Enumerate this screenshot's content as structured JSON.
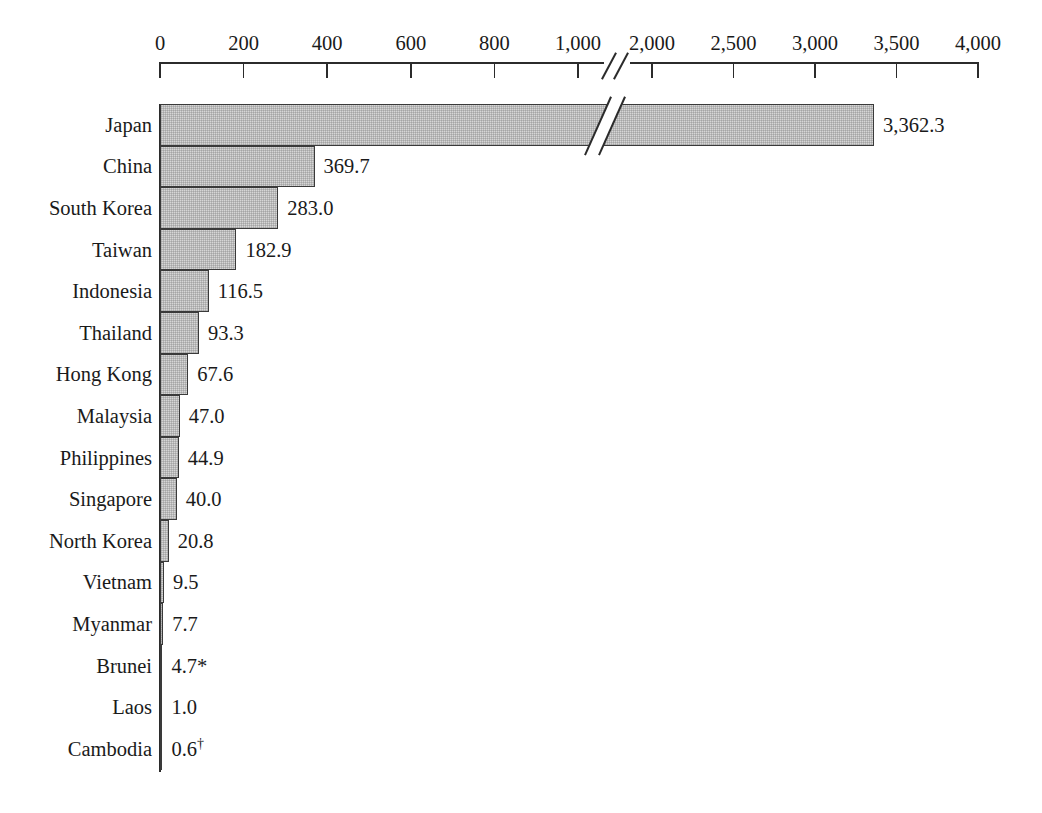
{
  "chart_data": {
    "type": "bar",
    "orientation": "horizontal",
    "title": "",
    "subtitle": "",
    "xlabel": "",
    "ylabel": "",
    "grid": false,
    "legend": null,
    "axis_break": {
      "present": true,
      "between": [
        1000,
        2000
      ],
      "note": "scale compresses between 1,000 and 2,000"
    },
    "xticks": [
      {
        "value": 0,
        "label": "0"
      },
      {
        "value": 200,
        "label": "200"
      },
      {
        "value": 400,
        "label": "400"
      },
      {
        "value": 600,
        "label": "600"
      },
      {
        "value": 800,
        "label": "800"
      },
      {
        "value": 1000,
        "label": "1,000"
      },
      {
        "value": 2000,
        "label": "2,000"
      },
      {
        "value": 2500,
        "label": "2,500"
      },
      {
        "value": 3000,
        "label": "3,000"
      },
      {
        "value": 3500,
        "label": "3,500"
      },
      {
        "value": 4000,
        "label": "4,000"
      }
    ],
    "xlim": [
      0,
      4000
    ],
    "categories": [
      "Japan",
      "China",
      "South Korea",
      "Taiwan",
      "Indonesia",
      "Thailand",
      "Hong Kong",
      "Malaysia",
      "Philippines",
      "Singapore",
      "North Korea",
      "Vietnam",
      "Myanmar",
      "Brunei",
      "Laos",
      "Cambodia"
    ],
    "values": [
      3362.3,
      369.7,
      283.0,
      182.9,
      116.5,
      93.3,
      67.6,
      47.0,
      44.9,
      40.0,
      20.8,
      9.5,
      7.7,
      4.7,
      1.0,
      0.6
    ],
    "value_labels": [
      "3,362.3",
      "369.7",
      "283.0",
      "182.9",
      "116.5",
      "93.3",
      "67.6",
      "47.0",
      "44.9",
      "40.0",
      "20.8",
      "9.5",
      "7.7",
      "4.7",
      "1.0",
      "0.6"
    ],
    "value_label_marks": [
      "",
      "",
      "",
      "",
      "",
      "",
      "",
      "",
      "",
      "",
      "",
      "",
      "",
      "*",
      "",
      "†"
    ],
    "bar_fill_color": "#d6d6d6",
    "bar_border_color": "#3a3a3a",
    "background_color": "#ffffff",
    "text_color": "#1a1a1a"
  },
  "layout": {
    "plot_left_px": 160,
    "axis_right_px": 978,
    "segment1_value_span": 1000,
    "segment1_px_span": 418,
    "segment2_value_start": 2000,
    "segment2_value_end": 4000,
    "segment2_px_start": 652,
    "segment2_px_end": 978,
    "bars_top_px": 104,
    "bar_height_px": 41.6,
    "label_right_px": 152,
    "axis_line_y_px": 62,
    "tick_label_y_px": 33,
    "tick_length_px": 16
  }
}
